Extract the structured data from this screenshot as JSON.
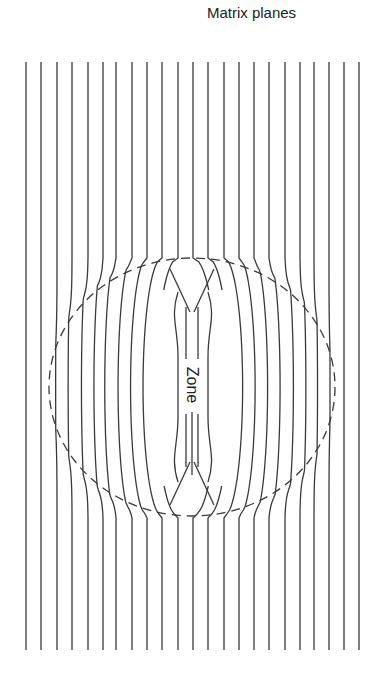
{
  "title": "Matrix planes",
  "zone_label": "Zone",
  "colors": {
    "line": "#3a3a3a",
    "dash": "#3a3a3a",
    "background": "#ffffff",
    "text": "#222222"
  },
  "geometry": {
    "top": 62,
    "bottom": 652,
    "ellipse": {
      "cx": 192,
      "cy": 387,
      "rx": 143,
      "ry": 129
    },
    "zone_center": {
      "x": 192,
      "y": 385
    }
  },
  "planes_x": [
    26,
    41,
    57,
    72,
    88,
    103,
    116,
    132,
    147,
    162,
    178,
    193,
    208,
    224,
    239,
    254,
    269,
    285,
    300,
    314,
    329,
    344,
    359
  ]
}
